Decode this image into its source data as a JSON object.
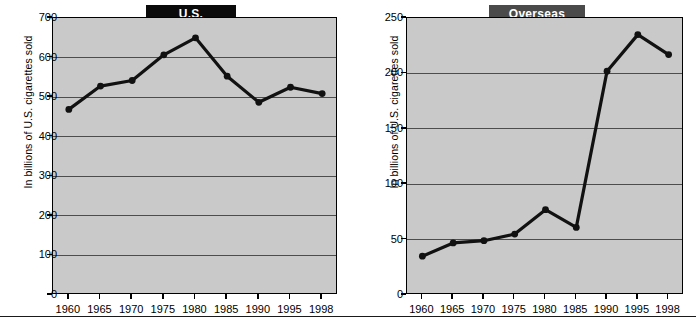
{
  "figure": {
    "background": "#ffffff",
    "plot_background": "#c9c9c9",
    "line_color": "#111111",
    "gridline_color": "#4d4d4d"
  },
  "panels": [
    {
      "id": "us",
      "banner_label": "U.S.",
      "banner_color": "#0a0a0a",
      "ylabel": "In billions of U.S. cigarettes sold"
    },
    {
      "id": "overseas",
      "banner_label": "Overseas",
      "banner_color": "#4a4a4a",
      "ylabel": "In billions of U.S. cigarettes sold"
    }
  ],
  "chart_data": [
    {
      "type": "line",
      "title": "U.S.",
      "xlabel": "",
      "ylabel": "In billions of U.S. cigarettes sold",
      "categories": [
        "1960",
        "1965",
        "1970",
        "1975",
        "1980",
        "1985",
        "1990",
        "1995",
        "1998"
      ],
      "x": [
        1960,
        1965,
        1970,
        1975,
        1980,
        1985,
        1990,
        1995,
        1998
      ],
      "values": [
        469,
        528,
        542,
        607,
        650,
        553,
        487,
        525,
        509
      ],
      "ylim": [
        0,
        700
      ],
      "yticks": [
        0,
        100,
        200,
        300,
        400,
        500,
        600,
        700
      ],
      "ytick_labels": [
        "0",
        "100",
        "200",
        "300",
        "400",
        "500",
        "600",
        "700"
      ],
      "grid": true,
      "legend": "none",
      "marker": "circle"
    },
    {
      "type": "line",
      "title": "Overseas",
      "xlabel": "",
      "ylabel": "In billions of U.S. cigarettes sold",
      "categories": [
        "1960",
        "1965",
        "1970",
        "1975",
        "1980",
        "1985",
        "1990",
        "1995",
        "1998"
      ],
      "x": [
        1960,
        1965,
        1970,
        1975,
        1980,
        1985,
        1990,
        1995,
        1998
      ],
      "values": [
        35,
        47,
        49,
        55,
        77,
        61,
        202,
        235,
        217
      ],
      "ylim": [
        0,
        250
      ],
      "yticks": [
        0,
        50,
        100,
        150,
        200,
        250
      ],
      "ytick_labels": [
        "0",
        "50",
        "100",
        "150",
        "200",
        "250"
      ],
      "grid": true,
      "legend": "none",
      "marker": "circle"
    }
  ]
}
